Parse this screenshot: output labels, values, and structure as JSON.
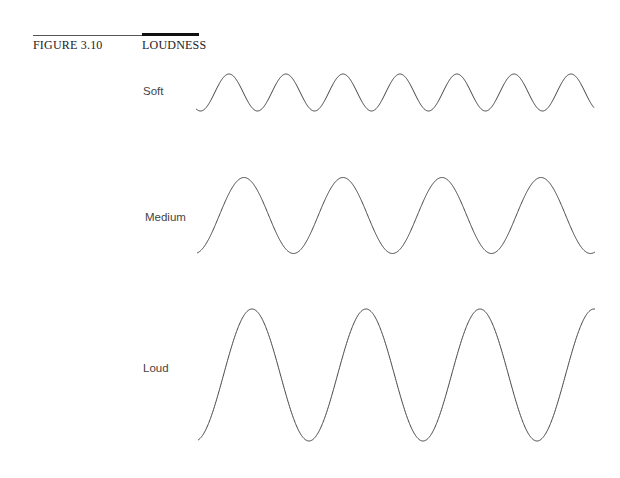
{
  "figure": {
    "number": "FIGURE 3.10",
    "title": "LOUDNESS"
  },
  "chart_data": {
    "type": "line",
    "title": "LOUDNESS",
    "xlabel": "",
    "ylabel": "",
    "grid": false,
    "series": [
      {
        "name": "Soft",
        "label_x": 143,
        "label_y": 85,
        "x_start": 196,
        "x_end": 594,
        "center_y": 92.5,
        "amplitude": 18.5,
        "period": 57,
        "first_peak_x": 229,
        "peaks": 7
      },
      {
        "name": "Medium",
        "label_x": 145,
        "label_y": 211,
        "x_start": 197,
        "x_end": 595,
        "center_y": 215.5,
        "amplitude": 38,
        "period": 99,
        "first_peak_x": 244,
        "peaks": 4
      },
      {
        "name": "Loud",
        "label_x": 143,
        "label_y": 362,
        "x_start": 198,
        "x_end": 595,
        "center_y": 375,
        "amplitude": 66,
        "period": 114,
        "first_peak_x": 252,
        "peaks": 4
      }
    ]
  }
}
